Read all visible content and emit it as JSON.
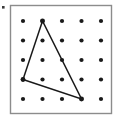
{
  "figure": {
    "canvas": {
      "width": 118,
      "height": 120,
      "background": "#ffffff"
    },
    "board": {
      "label": "geoboard-frame",
      "x": 10.5,
      "y": 5.5,
      "width": 101,
      "height": 108,
      "fill": "#ffffff",
      "stroke": "#8c8c8c",
      "stroke_width": 1.4
    },
    "grid": {
      "label": "peg-grid",
      "rows": 5,
      "cols": 5,
      "col_x": [
        23,
        42.5,
        62,
        81.5,
        101
      ],
      "row_y": [
        21,
        40.5,
        60,
        79.5,
        99
      ],
      "dot_radius": 2.1,
      "dot_color": "#1a1a1a"
    },
    "shape": {
      "label": "triangle",
      "type": "polygon",
      "stroke": "#1a1a1a",
      "stroke_width": 1.5,
      "fill": "none",
      "vertices": [
        {
          "name": "apex",
          "grid_col": 2,
          "grid_row": 1,
          "x": 42.5,
          "y": 21
        },
        {
          "name": "left",
          "grid_col": 1,
          "grid_row": 4,
          "x": 23,
          "y": 79.5
        },
        {
          "name": "bottom-right",
          "grid_col": 4,
          "grid_row": 5,
          "x": 81.5,
          "y": 99
        }
      ],
      "points": "42.5,21 23,79.5 81.5,99",
      "vertex_marker_radius": 2.4
    },
    "artifact": {
      "label": "stray-speck",
      "x": 2,
      "y": 6,
      "width": 2.6,
      "height": 2.6,
      "color": "#3a3a3a"
    }
  }
}
